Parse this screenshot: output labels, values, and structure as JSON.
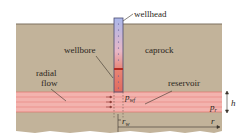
{
  "labels": {
    "wellhead": "wellhead",
    "wellbore": "wellbore",
    "caprock": "caprock",
    "radial_flow_line1": "radial",
    "radial_flow_line2": "flow",
    "reservoir": "reservoir",
    "p_wf": "p",
    "p_wf_sub": "wf",
    "p_r": "p",
    "p_r_sub": "r",
    "h": "h",
    "r_w": "r",
    "r_w_sub": "w",
    "r": "r"
  },
  "colors": {
    "rock": "#c2b39a",
    "rock_edge": "#7d705e",
    "reservoir_band": "#f3b3ae",
    "reservoir_line": "#e0746c",
    "wellbore_top": "#aab7ea",
    "wellbore_bottom": "#e06a5e",
    "text": "#2a2620"
  }
}
